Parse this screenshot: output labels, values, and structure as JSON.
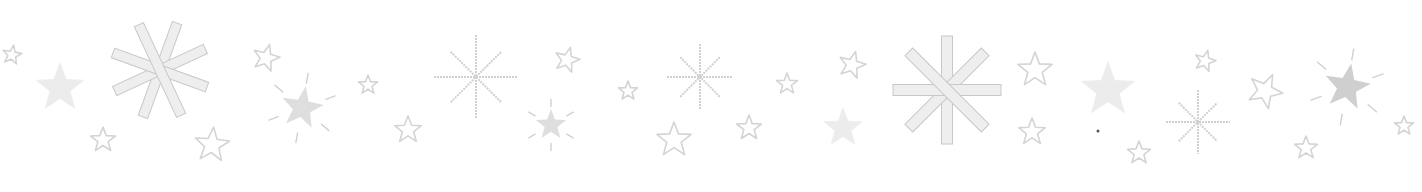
{
  "canvas": {
    "width": 1422,
    "height": 192,
    "background": "#ffffff"
  },
  "colors": {
    "outline": "#d4d4d4",
    "fill_light": "#ececec",
    "fill_mid": "#dedede",
    "fill_dark": "#cfcfcf",
    "bar_fill": "#eeeeee",
    "bar_stroke": "#c8c8c8",
    "thin_line": "#d0d0d0"
  },
  "decorations": [
    {
      "type": "outline-star",
      "x": 12,
      "y": 55,
      "r": 10,
      "rot": 10
    },
    {
      "type": "filled-star",
      "x": 60,
      "y": 88,
      "r": 25,
      "rot": 0,
      "shade": "fill_light"
    },
    {
      "type": "asterisk-bars",
      "x": 160,
      "y": 70,
      "r": 50,
      "rot": 20,
      "barw": 10
    },
    {
      "type": "outline-star",
      "x": 103,
      "y": 140,
      "r": 13,
      "rot": 0
    },
    {
      "type": "outline-star",
      "x": 212,
      "y": 145,
      "r": 18,
      "rot": 5
    },
    {
      "type": "outline-star",
      "x": 266,
      "y": 58,
      "r": 14,
      "rot": 15
    },
    {
      "type": "burst-star",
      "x": 302,
      "y": 108,
      "r": 22,
      "rot": 10,
      "shade": "fill_mid"
    },
    {
      "type": "outline-star",
      "x": 368,
      "y": 85,
      "r": 10,
      "rot": 0
    },
    {
      "type": "thin-burst",
      "x": 476,
      "y": 77,
      "r": 42,
      "rot": 0
    },
    {
      "type": "outline-star",
      "x": 408,
      "y": 130,
      "r": 14,
      "rot": 0
    },
    {
      "type": "outline-star",
      "x": 567,
      "y": 60,
      "r": 13,
      "rot": 15
    },
    {
      "type": "burst-star",
      "x": 551,
      "y": 125,
      "r": 16,
      "rot": 0,
      "shade": "fill_mid"
    },
    {
      "type": "outline-star",
      "x": 628,
      "y": 91,
      "r": 10,
      "rot": 0
    },
    {
      "type": "outline-star",
      "x": 674,
      "y": 140,
      "r": 18,
      "rot": 0
    },
    {
      "type": "thin-burst",
      "x": 700,
      "y": 77,
      "r": 33,
      "rot": 0
    },
    {
      "type": "outline-star",
      "x": 749,
      "y": 128,
      "r": 13,
      "rot": 0
    },
    {
      "type": "outline-star",
      "x": 787,
      "y": 84,
      "r": 11,
      "rot": 0
    },
    {
      "type": "outline-star",
      "x": 852,
      "y": 65,
      "r": 14,
      "rot": 15
    },
    {
      "type": "filled-star",
      "x": 843,
      "y": 128,
      "r": 20,
      "rot": 0,
      "shade": "fill_light"
    },
    {
      "type": "asterisk-bars",
      "x": 947,
      "y": 90,
      "r": 54,
      "rot": 0,
      "barw": 11
    },
    {
      "type": "outline-star",
      "x": 1035,
      "y": 70,
      "r": 18,
      "rot": 0
    },
    {
      "type": "outline-star",
      "x": 1032,
      "y": 132,
      "r": 14,
      "rot": 0
    },
    {
      "type": "filled-star",
      "x": 1108,
      "y": 90,
      "r": 28,
      "rot": 0,
      "shade": "fill_light"
    },
    {
      "type": "dot",
      "x": 1098,
      "y": 131,
      "r": 1.5
    },
    {
      "type": "outline-star",
      "x": 1139,
      "y": 153,
      "r": 12,
      "rot": 0
    },
    {
      "type": "outline-star",
      "x": 1205,
      "y": 61,
      "r": 11,
      "rot": 15
    },
    {
      "type": "thin-burst",
      "x": 1198,
      "y": 122,
      "r": 32,
      "rot": 0
    },
    {
      "type": "outline-star",
      "x": 1265,
      "y": 91,
      "r": 18,
      "rot": 25
    },
    {
      "type": "outline-star",
      "x": 1306,
      "y": 148,
      "r": 12,
      "rot": 0
    },
    {
      "type": "burst-star",
      "x": 1347,
      "y": 87,
      "r": 24,
      "rot": 10,
      "shade": "fill_dark"
    },
    {
      "type": "outline-star",
      "x": 1404,
      "y": 126,
      "r": 10,
      "rot": 0
    }
  ]
}
